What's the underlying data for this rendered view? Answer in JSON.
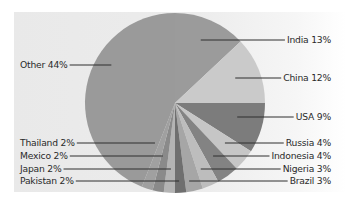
{
  "chart_data": {
    "type": "pie",
    "title": "",
    "start_angle_deg": 0,
    "direction": "clockwise",
    "slices": [
      {
        "label": "India",
        "value": 13,
        "display": "India 13%",
        "color": "#9b9b9b",
        "side": "right",
        "label_y": 40
      },
      {
        "label": "China",
        "value": 12,
        "display": "China 12%",
        "color": "#cacaca",
        "side": "right",
        "label_y": 78
      },
      {
        "label": "USA",
        "value": 9,
        "display": "USA 9%",
        "color": "#7c7c7c",
        "side": "right",
        "label_y": 117
      },
      {
        "label": "Russia",
        "value": 4,
        "display": "Russia 4%",
        "color": "#c6c6c6",
        "side": "right",
        "label_y": 143
      },
      {
        "label": "Indonesia",
        "value": 4,
        "display": "Indonesia 4%",
        "color": "#838383",
        "side": "right",
        "label_y": 156
      },
      {
        "label": "Nigeria",
        "value": 3,
        "display": "Nigeria 3%",
        "color": "#bdbdbd",
        "side": "right",
        "label_y": 169
      },
      {
        "label": "Brazil",
        "value": 3,
        "display": "Brazil 3%",
        "color": "#a6a6a6",
        "side": "right",
        "label_y": 181
      },
      {
        "label": "Pakistan",
        "value": 2,
        "display": "Pakistan 2%",
        "color": "#6f6f6f",
        "side": "left",
        "label_y": 181
      },
      {
        "label": "Japan",
        "value": 2,
        "display": "Japan 2%",
        "color": "#b4b4b4",
        "side": "left",
        "label_y": 169
      },
      {
        "label": "Mexico",
        "value": 2,
        "display": "Mexico 2%",
        "color": "#8a8a8a",
        "side": "left",
        "label_y": 156
      },
      {
        "label": "Thailand",
        "value": 2,
        "display": "Thailand 2%",
        "color": "#a0a0a0",
        "side": "left",
        "label_y": 143
      },
      {
        "label": "Other",
        "value": 44,
        "display": "Other 44%",
        "color": "#9a9a9a",
        "side": "left",
        "label_y": 65
      }
    ],
    "legend": "leader-line labels",
    "grid": false
  },
  "layout": {
    "cx": 175,
    "cy": 103,
    "r": 90,
    "right_label_x": 331,
    "left_label_x": 20
  }
}
